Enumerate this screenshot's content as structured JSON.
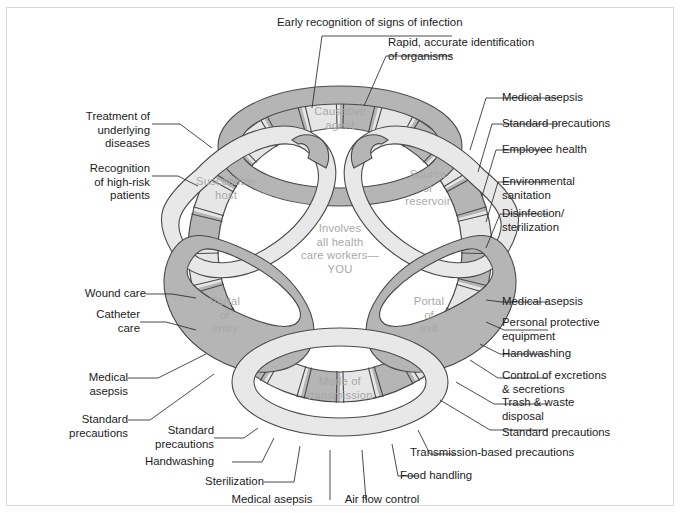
{
  "figure": {
    "colors": {
      "band_dark": "#b5b5b5",
      "band_light": "#e6e6e6",
      "outline": "#4a4a4a",
      "ring_label": "#a8a8a8",
      "text": "#1b1b1b",
      "border": "#d9d9d9",
      "background": "#ffffff"
    }
  },
  "ring_labels": [
    {
      "id": "causative-agent",
      "text": "Causative\nagent"
    },
    {
      "id": "source-or-reservoir",
      "text": "Source\nor\nreservoir"
    },
    {
      "id": "portal-of-exit",
      "text": "Portal\nof\nexit"
    },
    {
      "id": "mode-of-transmission",
      "text": "Mode of\ntransmission"
    },
    {
      "id": "portal-of-entry",
      "text": "Portal\nof\nentry"
    },
    {
      "id": "susceptible-host",
      "text": "Susceptible\nhost"
    }
  ],
  "center_note": {
    "id": "involves-all-health-care-workers",
    "text": "Involves\nall health\ncare workers—\nYOU"
  },
  "callouts": {
    "top": [
      {
        "id": "early-recognition-of-signs-of-infection",
        "text": "Early recognition of signs of infection"
      },
      {
        "id": "rapid-accurate-identification-of-organisms",
        "text": "Rapid, accurate identification\nof organisms"
      }
    ],
    "upper_left": [
      {
        "id": "treatment-of-underlying-diseases",
        "text": "Treatment of\nunderlying\ndiseases"
      },
      {
        "id": "recognition-of-high-risk-patients",
        "text": "Recognition\nof high-risk\npatients"
      }
    ],
    "upper_right": [
      {
        "id": "medical-asepsis-source",
        "text": "Medical asepsis"
      },
      {
        "id": "standard-precautions-source",
        "text": "Standard precautions"
      },
      {
        "id": "employee-health",
        "text": "Employee health"
      },
      {
        "id": "environmental-sanitation",
        "text": "Environmental\nsanitation"
      },
      {
        "id": "disinfection-sterilization",
        "text": "Disinfection/\nsterilization"
      }
    ],
    "lower_left": [
      {
        "id": "wound-care",
        "text": "Wound care"
      },
      {
        "id": "catheter-care",
        "text": "Catheter\ncare"
      },
      {
        "id": "medical-asepsis-entry",
        "text": "Medical\nasepsis"
      },
      {
        "id": "standard-precautions-entry",
        "text": "Standard\nprecautions"
      }
    ],
    "lower_right": [
      {
        "id": "medical-asepsis-exit",
        "text": "Medical asepsis"
      },
      {
        "id": "personal-protective-equipment",
        "text": "Personal protective\nequipment"
      },
      {
        "id": "handwashing-exit",
        "text": "Handwashing"
      },
      {
        "id": "control-of-excretions-secretions",
        "text": "Control of excretions\n& secretions"
      },
      {
        "id": "trash-waste-disposal",
        "text": "Trash & waste\ndisposal"
      },
      {
        "id": "standard-precautions-exit",
        "text": "Standard precautions"
      }
    ],
    "bottom": [
      {
        "id": "standard-precautions-transmission",
        "text": "Standard\nprecautions"
      },
      {
        "id": "handwashing-transmission",
        "text": "Handwashing"
      },
      {
        "id": "sterilization-transmission",
        "text": "Sterilization"
      },
      {
        "id": "medical-asepsis-transmission",
        "text": "Medical asepsis"
      },
      {
        "id": "air-flow-control",
        "text": "Air flow control"
      },
      {
        "id": "food-handling",
        "text": "Food handling"
      },
      {
        "id": "transmission-based-precautions",
        "text": "Transmission-based precautions"
      }
    ]
  }
}
